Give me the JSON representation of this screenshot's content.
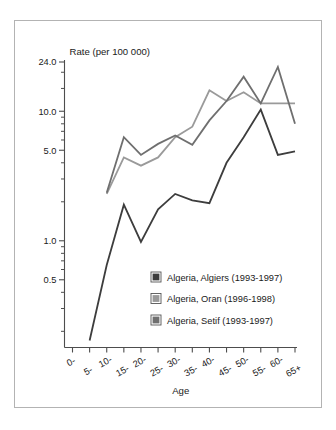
{
  "figure": {
    "border_color": "#b3b3b3",
    "background": "#ffffff"
  },
  "chart_data": {
    "type": "line",
    "title": "",
    "ylabel": "Rate (per 100 000)",
    "xlabel": "Age",
    "yscale": "log",
    "ylim": [
      0.15,
      24.0
    ],
    "grid": false,
    "legend_position": "inside-lower-right",
    "categories": [
      "0-",
      "5-",
      "10-",
      "15-",
      "20-",
      "25-",
      "30-",
      "35-",
      "40-",
      "45-",
      "50-",
      "55-",
      "60-",
      "65+"
    ],
    "ytick_labels": [
      "24.0",
      "10.0",
      "5.0",
      "1.0",
      "0.5"
    ],
    "ytick_values": [
      24.0,
      10.0,
      5.0,
      1.0,
      0.5
    ],
    "yminor_values": [
      20.0,
      15.0,
      9.0,
      8.0,
      7.0,
      6.0,
      4.0,
      3.0,
      2.0,
      0.9,
      0.8,
      0.7,
      0.6,
      0.4,
      0.3,
      0.2
    ],
    "series": [
      {
        "name": "Algeria, Algiers (1993-1997)",
        "color": "#3d3d3d",
        "x": [
          "5-",
          "10-",
          "15-",
          "20-",
          "25-",
          "30-",
          "35-",
          "40-",
          "45-",
          "50-",
          "55-",
          "60-",
          "65+"
        ],
        "values": [
          0.17,
          0.65,
          1.9,
          0.98,
          1.75,
          2.3,
          2.05,
          1.95,
          4.0,
          6.3,
          10.3,
          4.6,
          4.9
        ]
      },
      {
        "name": "Algeria, Oran (1996-1998)",
        "color": "#9a9a9a",
        "x": [
          "10-",
          "15-",
          "20-",
          "25-",
          "30-",
          "35-",
          "40-",
          "45-",
          "50-",
          "55-",
          "60-",
          "65+"
        ],
        "values": [
          2.3,
          4.4,
          3.8,
          4.4,
          6.3,
          7.6,
          14.5,
          12.0,
          14.0,
          11.5,
          11.5,
          11.5
        ]
      },
      {
        "name": "Algeria, Setif (1993-1997)",
        "color": "#6f6f6f",
        "x": [
          "10-",
          "15-",
          "20-",
          "25-",
          "30-",
          "35-",
          "40-",
          "45-",
          "50-",
          "55-",
          "60-",
          "65+"
        ],
        "values": [
          2.35,
          6.3,
          4.6,
          5.6,
          6.5,
          5.5,
          8.5,
          12.0,
          18.5,
          11.5,
          22.0,
          8.0
        ]
      }
    ]
  },
  "legend": {
    "entries": [
      {
        "label": "Algeria, Algiers (1993-1997)",
        "color": "#3d3d3d"
      },
      {
        "label": "Algeria, Oran (1996-1998)",
        "color": "#9a9a9a"
      },
      {
        "label": "Algeria, Setif (1993-1997)",
        "color": "#6f6f6f"
      }
    ]
  }
}
